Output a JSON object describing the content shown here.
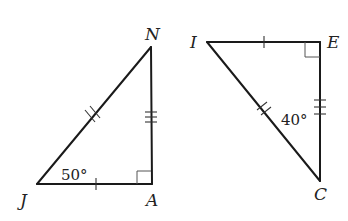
{
  "diagram": {
    "type": "congruent-right-triangles",
    "triangles": [
      {
        "name": "triangle-JAN",
        "vertices": {
          "J": {
            "label": "J",
            "x": 37,
            "y": 184
          },
          "A": {
            "label": "A",
            "x": 152,
            "y": 184
          },
          "N": {
            "label": "N",
            "x": 151,
            "y": 47
          }
        },
        "right_angle_at": "A",
        "angle_label": {
          "vertex": "J",
          "text": "50°"
        },
        "tick_marks": {
          "JA": 1,
          "JN": 2,
          "AN": 3
        }
      },
      {
        "name": "triangle-IEC",
        "vertices": {
          "I": {
            "label": "I",
            "x": 207,
            "y": 42
          },
          "E": {
            "label": "E",
            "x": 320,
            "y": 42
          },
          "C": {
            "label": "C",
            "x": 320,
            "y": 181
          }
        },
        "right_angle_at": "E",
        "angle_label": {
          "vertex": "C",
          "text": "40°"
        },
        "tick_marks": {
          "IE": 1,
          "IC": 2,
          "EC": 3
        }
      }
    ]
  },
  "labels": {
    "J": "J",
    "A": "A",
    "N": "N",
    "I": "I",
    "E": "E",
    "C": "C",
    "angle_J": "50°",
    "angle_C": "40°"
  }
}
